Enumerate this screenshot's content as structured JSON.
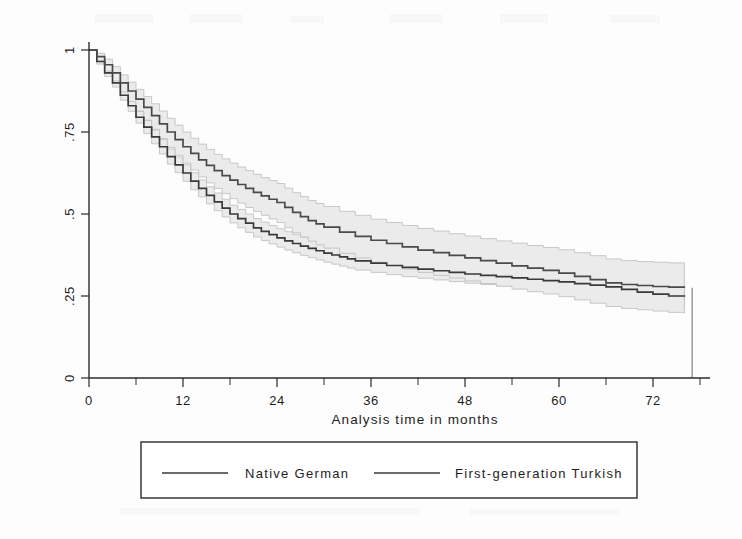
{
  "figure": {
    "kind": "kaplan-meier-survival-plot",
    "background_color": "#fdfdfd",
    "band_fill_color": "#ebebeb",
    "line_color": "#3a3a3a"
  },
  "chart_data": {
    "type": "line",
    "subtype": "kaplan-meier-step-survival",
    "title": "",
    "xlabel": "Analysis time in months",
    "ylabel": "",
    "xlim": [
      0,
      78
    ],
    "ylim": [
      0,
      1
    ],
    "grid": false,
    "legend_position": "bottom-outside",
    "xticks": [
      0,
      12,
      24,
      36,
      48,
      60,
      72
    ],
    "xtick_labels": [
      "0",
      "12",
      "24",
      "36",
      "48",
      "60",
      "72"
    ],
    "xtick_minor_step": 6,
    "yticks": [
      0,
      0.25,
      0.5,
      0.75,
      1
    ],
    "ytick_labels": [
      "0",
      ".25",
      ".5",
      ".75",
      "1"
    ],
    "series": [
      {
        "name": "Native German",
        "legend_label": "Native German",
        "x": [
          0,
          1,
          2,
          3,
          4,
          5,
          6,
          7,
          8,
          9,
          10,
          11,
          12,
          13,
          14,
          15,
          16,
          17,
          18,
          19,
          20,
          21,
          22,
          23,
          24,
          25,
          26,
          27,
          28,
          29,
          30,
          31,
          32,
          33,
          34,
          36,
          38,
          40,
          42,
          44,
          46,
          48,
          50,
          52,
          54,
          56,
          58,
          60,
          62,
          64,
          66,
          68,
          70,
          72,
          74,
          76
        ],
        "values": [
          1.0,
          0.965,
          0.93,
          0.9,
          0.862,
          0.83,
          0.795,
          0.765,
          0.735,
          0.705,
          0.675,
          0.65,
          0.625,
          0.6,
          0.578,
          0.557,
          0.537,
          0.518,
          0.5,
          0.486,
          0.472,
          0.458,
          0.447,
          0.437,
          0.427,
          0.418,
          0.41,
          0.402,
          0.395,
          0.388,
          0.381,
          0.375,
          0.369,
          0.363,
          0.357,
          0.35,
          0.343,
          0.337,
          0.332,
          0.327,
          0.322,
          0.317,
          0.313,
          0.309,
          0.305,
          0.301,
          0.297,
          0.293,
          0.288,
          0.283,
          0.278,
          0.27,
          0.262,
          0.256,
          0.25,
          0.248
        ],
        "ci_lower": [
          1.0,
          0.957,
          0.919,
          0.887,
          0.847,
          0.813,
          0.777,
          0.745,
          0.714,
          0.683,
          0.652,
          0.626,
          0.6,
          0.574,
          0.552,
          0.531,
          0.51,
          0.491,
          0.473,
          0.458,
          0.444,
          0.43,
          0.419,
          0.409,
          0.399,
          0.39,
          0.382,
          0.374,
          0.367,
          0.36,
          0.353,
          0.347,
          0.341,
          0.335,
          0.329,
          0.322,
          0.315,
          0.309,
          0.304,
          0.299,
          0.294,
          0.289,
          0.285,
          0.281,
          0.277,
          0.273,
          0.268,
          0.263,
          0.257,
          0.251,
          0.245,
          0.236,
          0.227,
          0.22,
          0.212,
          0.21
        ],
        "ci_upper": [
          1.0,
          0.973,
          0.941,
          0.913,
          0.877,
          0.847,
          0.813,
          0.785,
          0.756,
          0.727,
          0.698,
          0.674,
          0.65,
          0.626,
          0.604,
          0.583,
          0.564,
          0.545,
          0.527,
          0.514,
          0.5,
          0.486,
          0.475,
          0.465,
          0.455,
          0.446,
          0.438,
          0.43,
          0.423,
          0.416,
          0.409,
          0.403,
          0.397,
          0.391,
          0.385,
          0.378,
          0.371,
          0.365,
          0.36,
          0.355,
          0.35,
          0.345,
          0.341,
          0.337,
          0.333,
          0.329,
          0.326,
          0.323,
          0.319,
          0.315,
          0.311,
          0.304,
          0.297,
          0.292,
          0.288,
          0.286
        ]
      },
      {
        "name": "First-generation Turkish",
        "legend_label": "First-generation Turkish",
        "x": [
          0,
          1,
          2,
          3,
          4,
          5,
          6,
          7,
          8,
          9,
          10,
          11,
          12,
          13,
          14,
          15,
          16,
          17,
          18,
          19,
          20,
          21,
          22,
          23,
          24,
          25,
          26,
          27,
          28,
          29,
          30,
          32,
          34,
          36,
          38,
          40,
          42,
          44,
          46,
          48,
          50,
          52,
          54,
          56,
          58,
          60,
          62,
          64,
          66,
          68,
          70,
          72,
          74,
          76
        ],
        "values": [
          1.0,
          0.98,
          0.955,
          0.93,
          0.9,
          0.875,
          0.85,
          0.825,
          0.8,
          0.775,
          0.75,
          0.727,
          0.705,
          0.685,
          0.665,
          0.648,
          0.632,
          0.617,
          0.603,
          0.59,
          0.578,
          0.566,
          0.555,
          0.545,
          0.535,
          0.52,
          0.505,
          0.492,
          0.48,
          0.47,
          0.46,
          0.445,
          0.432,
          0.42,
          0.41,
          0.4,
          0.39,
          0.382,
          0.374,
          0.366,
          0.358,
          0.35,
          0.342,
          0.335,
          0.328,
          0.32,
          0.31,
          0.3,
          0.29,
          0.285,
          0.282,
          0.279,
          0.277,
          0.275
        ],
        "ci_lower": [
          1.0,
          0.967,
          0.936,
          0.906,
          0.872,
          0.843,
          0.814,
          0.786,
          0.758,
          0.73,
          0.703,
          0.679,
          0.655,
          0.634,
          0.613,
          0.595,
          0.578,
          0.562,
          0.547,
          0.533,
          0.52,
          0.508,
          0.496,
          0.485,
          0.474,
          0.458,
          0.443,
          0.43,
          0.417,
          0.406,
          0.396,
          0.38,
          0.366,
          0.353,
          0.343,
          0.332,
          0.322,
          0.313,
          0.305,
          0.296,
          0.288,
          0.28,
          0.271,
          0.263,
          0.256,
          0.248,
          0.238,
          0.228,
          0.218,
          0.212,
          0.208,
          0.204,
          0.2,
          0.198
        ],
        "ci_upper": [
          1.0,
          0.99,
          0.972,
          0.95,
          0.924,
          0.902,
          0.88,
          0.858,
          0.836,
          0.814,
          0.792,
          0.771,
          0.75,
          0.731,
          0.713,
          0.697,
          0.682,
          0.668,
          0.655,
          0.643,
          0.632,
          0.621,
          0.611,
          0.602,
          0.593,
          0.579,
          0.565,
          0.553,
          0.541,
          0.532,
          0.523,
          0.508,
          0.496,
          0.484,
          0.474,
          0.465,
          0.456,
          0.448,
          0.44,
          0.433,
          0.425,
          0.418,
          0.411,
          0.404,
          0.398,
          0.391,
          0.382,
          0.373,
          0.363,
          0.358,
          0.355,
          0.353,
          0.351,
          0.35
        ]
      }
    ],
    "terminal_drop": {
      "x": 77,
      "from": 0.275,
      "to": 0.0,
      "note": "vertical censoring mark at right edge"
    }
  },
  "legend": {
    "entries": [
      {
        "label": "Native German"
      },
      {
        "label": "First-generation Turkish"
      }
    ]
  }
}
